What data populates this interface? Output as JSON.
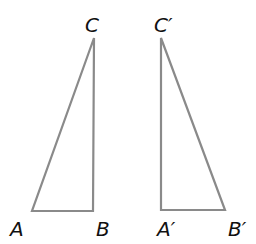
{
  "diagram": {
    "colors": {
      "edge": "#8a8a8a",
      "label": "#111111",
      "background": "#ffffff"
    },
    "triangles": [
      {
        "name": "ABC",
        "vertices": {
          "A": {
            "label": "A",
            "x": 32,
            "y": 211
          },
          "B": {
            "label": "B",
            "x": 93,
            "y": 211
          },
          "C": {
            "label": "C",
            "x": 94,
            "y": 38
          }
        }
      },
      {
        "name": "A'B'C'",
        "vertices": {
          "A": {
            "label": "A′",
            "x": 161,
            "y": 210
          },
          "B": {
            "label": "B′",
            "x": 225,
            "y": 210
          },
          "C": {
            "label": "C′",
            "x": 161,
            "y": 38
          }
        }
      }
    ]
  }
}
